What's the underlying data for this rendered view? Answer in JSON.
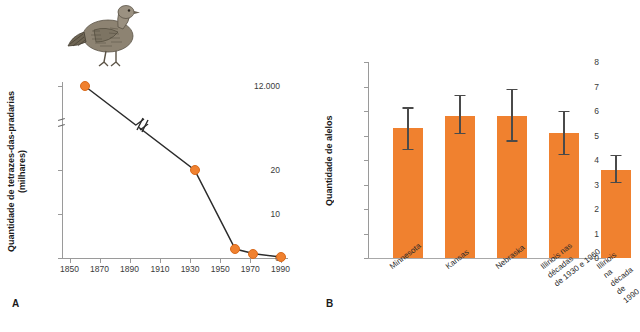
{
  "figure": {
    "panel_a_letter": "A",
    "panel_b_letter": "B"
  },
  "panel_a": {
    "illustration": "prairie-chicken-bird-illustration",
    "ylabel": "Quantidade de tetrazes-das-pradarias\n(milhares)",
    "accent_color": "#f0812f",
    "axis_break": true,
    "chart": {
      "type": "line",
      "title": "",
      "xlabel": "",
      "ylabel": "Quantidade de tetrazes-das-pradarias (milhares)",
      "x": [
        1860,
        1933,
        1960,
        1972,
        1990
      ],
      "values": [
        12000,
        23,
        2,
        1,
        0.2
      ],
      "xticks": [
        1850,
        1870,
        1890,
        1910,
        1930,
        1950,
        1970,
        1990
      ],
      "yticks": [
        "0",
        "10",
        "20",
        "12.000"
      ],
      "ytick_values": [
        0,
        10,
        20,
        12000
      ],
      "xlim": [
        1845,
        1995
      ],
      "ylim": [
        0,
        12000
      ],
      "grid": false,
      "legend": "none",
      "marker_color": "#f0812f",
      "line_color": "#2b2b2b",
      "note": "y-axis has a break between 20 and 12.000; the connecting line also carries a break slash"
    }
  },
  "panel_b": {
    "ylabel": "Quantidade de alelos",
    "accent_color": "#f0812f",
    "chart": {
      "type": "bar",
      "title": "",
      "xlabel": "",
      "ylabel": "Quantidade de alelos",
      "categories": [
        "Minnesota",
        "Kansas",
        "Nebraska",
        "Illinois nas décadas\nde 1930 e 1960",
        "Illinois na década\nde 1990"
      ],
      "values": [
        5.3,
        5.8,
        5.8,
        5.1,
        3.6
      ],
      "error_low": [
        4.4,
        5.05,
        4.75,
        4.2,
        3.05
      ],
      "error_high": [
        6.1,
        6.6,
        6.85,
        5.95,
        4.15
      ],
      "yticks": [
        0,
        1,
        2,
        3,
        4,
        5,
        6,
        7,
        8
      ],
      "ylim": [
        0,
        8
      ],
      "grid": false,
      "legend": "none",
      "bar_color": "#f0812f",
      "error_color": "#4a4a4a"
    }
  }
}
